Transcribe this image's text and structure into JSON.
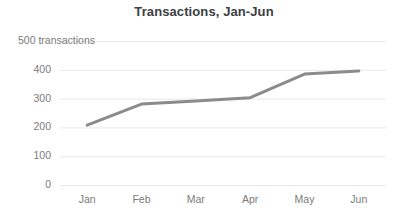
{
  "chart_data": {
    "type": "line",
    "title": "Transactions, Jan-Jun",
    "xlabel": "",
    "ylabel": "500 transactions",
    "categories": [
      "Jan",
      "Feb",
      "Mar",
      "Apr",
      "May",
      "Jun"
    ],
    "values": [
      208,
      281,
      292,
      303,
      385,
      396
    ],
    "series": [
      {
        "name": "Transactions",
        "values": [
          208,
          281,
          292,
          303,
          385,
          396
        ]
      }
    ],
    "ylim": [
      0,
      500
    ],
    "y_ticks": [
      "0",
      "100",
      "200",
      "300",
      "400",
      "500 transactions"
    ],
    "y_tick_values": [
      0,
      100,
      200,
      300,
      400,
      500
    ],
    "grid": true,
    "legend": "none",
    "line_color": "#8b8b8b",
    "grid_color": "#e8e8e8",
    "text_color": "#7b7b7b",
    "title_color": "#3c4043",
    "background_color": "#ffffff"
  }
}
